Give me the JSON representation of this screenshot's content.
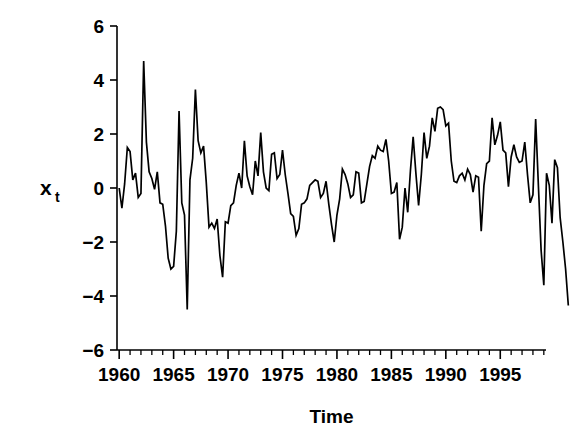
{
  "chart_data": {
    "type": "line",
    "title": "",
    "xlabel": "Time",
    "ylabel": "x_t",
    "ylabel_base": "x",
    "ylabel_sub": "t",
    "xlim": [
      1959.8,
      1999.2
    ],
    "ylim": [
      -6,
      6
    ],
    "grid": false,
    "legend": null,
    "xticks": [
      1960,
      1965,
      1970,
      1975,
      1980,
      1985,
      1990,
      1995
    ],
    "xtick_labels": [
      "1960",
      "1965",
      "1970",
      "1975",
      "1980",
      "1985",
      "1990",
      "1995"
    ],
    "xminor_interval": 1,
    "yticks": [
      -6,
      -4,
      -2,
      0,
      2,
      4,
      6
    ],
    "ytick_labels": [
      "−6",
      "−4",
      "−2",
      "0",
      "2",
      "4",
      "6"
    ],
    "line_color": "#000000",
    "x_start": 1960.0,
    "x_step": 0.25,
    "series": [
      {
        "name": "xt",
        "values": [
          0.0,
          -0.75,
          0.15,
          1.5,
          1.35,
          0.3,
          0.55,
          -0.35,
          -0.2,
          4.7,
          1.7,
          0.6,
          0.35,
          -0.05,
          0.6,
          -0.55,
          -0.6,
          -1.4,
          -2.6,
          -3.0,
          -2.9,
          -1.6,
          2.85,
          -0.55,
          -1.0,
          -4.5,
          0.3,
          1.1,
          3.65,
          1.75,
          1.3,
          1.55,
          0.2,
          -1.45,
          -1.3,
          -1.5,
          -1.15,
          -2.5,
          -3.3,
          -1.25,
          -1.3,
          -0.65,
          -0.55,
          0.1,
          0.55,
          0.0,
          1.75,
          0.45,
          0.05,
          -0.25,
          1.0,
          0.45,
          2.05,
          0.6,
          0.0,
          -0.1,
          1.25,
          1.3,
          0.35,
          0.5,
          1.4,
          0.5,
          -0.2,
          -0.95,
          -1.05,
          -1.75,
          -1.5,
          -0.6,
          -0.55,
          -0.4,
          0.1,
          0.2,
          0.3,
          0.25,
          -0.35,
          -0.2,
          0.25,
          -0.6,
          -1.35,
          -2.0,
          -1.0,
          -0.4,
          0.7,
          0.5,
          0.15,
          -0.35,
          -0.25,
          0.6,
          0.55,
          -0.55,
          -0.5,
          0.15,
          0.8,
          1.2,
          1.1,
          1.55,
          1.4,
          1.35,
          1.8,
          1.0,
          -0.2,
          -0.15,
          0.2,
          -1.9,
          -1.45,
          0.0,
          -0.9,
          0.65,
          1.9,
          0.55,
          -0.65,
          0.5,
          2.05,
          1.1,
          1.55,
          2.6,
          2.1,
          2.95,
          3.0,
          2.9,
          2.3,
          2.4,
          1.0,
          0.25,
          0.2,
          0.45,
          0.55,
          0.3,
          0.7,
          0.5,
          -0.15,
          0.45,
          0.4,
          -1.6,
          0.1,
          0.9,
          1.0,
          2.6,
          1.6,
          1.95,
          2.45,
          1.4,
          1.3,
          0.05,
          1.15,
          1.6,
          1.15,
          0.95,
          1.0,
          1.7,
          0.5,
          -0.55,
          -0.25,
          2.55,
          0.1,
          -2.3,
          -3.6,
          0.55,
          0.1,
          -1.3,
          1.05,
          0.75,
          -1.1,
          -2.0,
          -3.0,
          -4.35
        ]
      }
    ]
  },
  "axes": {
    "y_axis_name": "y-axis",
    "x_axis_name": "x-axis"
  }
}
